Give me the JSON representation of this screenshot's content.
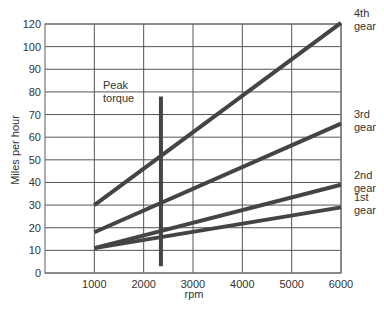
{
  "chart_data": {
    "type": "line",
    "title": "",
    "xlabel": "rpm",
    "ylabel": "Miles per hour",
    "x_ticks": [
      1000,
      2000,
      3000,
      4000,
      5000,
      6000
    ],
    "y_ticks": [
      0,
      10,
      20,
      30,
      40,
      50,
      60,
      70,
      80,
      90,
      100,
      120
    ],
    "xlim": [
      0,
      6000
    ],
    "ylim": [
      0,
      120
    ],
    "grid": true,
    "legend_position": "inline-right",
    "series": [
      {
        "name": "4th gear",
        "label_lines": [
          "4th",
          "gear"
        ],
        "x": [
          1000,
          6000
        ],
        "y": [
          30,
          121
        ]
      },
      {
        "name": "3rd gear",
        "label_lines": [
          "3rd",
          "gear"
        ],
        "x": [
          1000,
          6000
        ],
        "y": [
          18,
          66
        ]
      },
      {
        "name": "2nd gear",
        "label_lines": [
          "2nd",
          "gear"
        ],
        "x": [
          1000,
          6000
        ],
        "y": [
          11,
          39
        ]
      },
      {
        "name": "1st gear",
        "label_lines": [
          "1st",
          "gear"
        ],
        "x": [
          1000,
          6000
        ],
        "y": [
          11,
          29
        ]
      }
    ],
    "annotations": [
      {
        "type": "vertical-bar",
        "label_lines": [
          "Peak",
          "torque"
        ],
        "x": 2350,
        "y_from": 3,
        "y_to": 78
      }
    ],
    "colors": {
      "lines": "#444444",
      "grid": "#555555",
      "frame": "#777777",
      "text": "#333333"
    }
  }
}
